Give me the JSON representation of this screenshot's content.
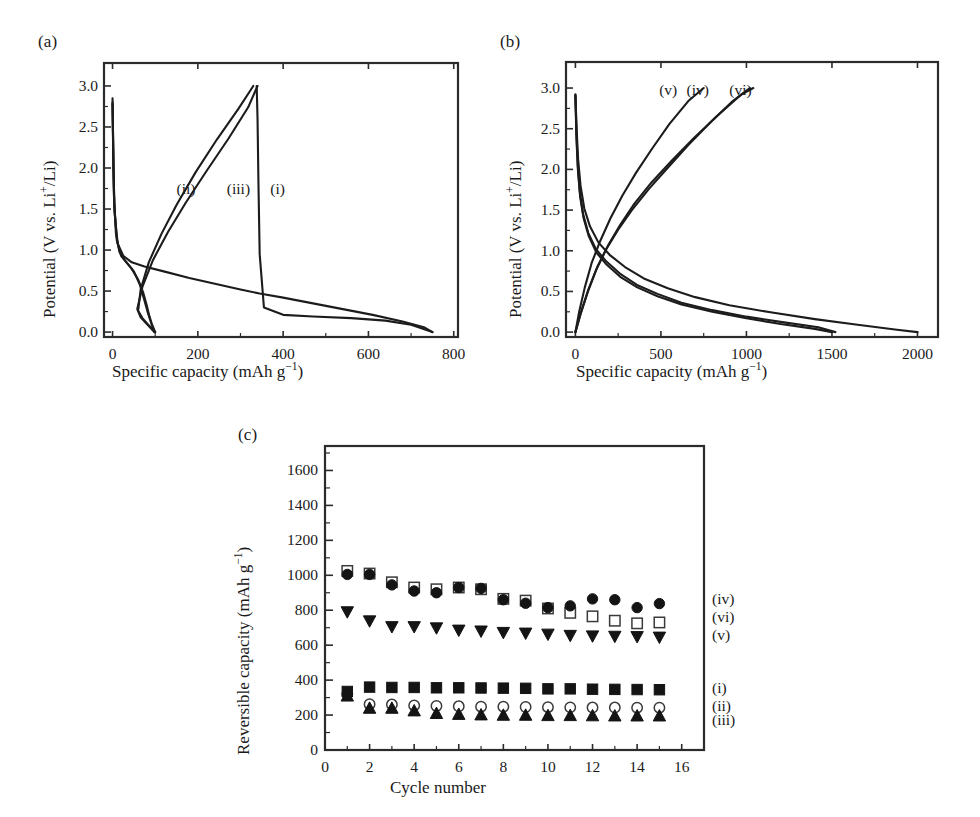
{
  "figure": {
    "background": "#ffffff",
    "line_color": "#1c1c1c",
    "axis_color": "#2b2b2b"
  },
  "panels": {
    "a": {
      "tag": "(a)",
      "xlabel_main": "Specific capacity (mAh g",
      "xlabel_sup": "−1",
      "xlabel_tail": ")",
      "ylabel_main": "Potential (V vs. Li",
      "ylabel_sup": "+",
      "ylabel_tail": "/Li)",
      "xticks": [
        "0",
        "200",
        "400",
        "600",
        "800"
      ],
      "xtick_values": [
        0,
        200,
        400,
        600,
        800
      ],
      "yticks": [
        "0.0",
        "0.5",
        "1.0",
        "1.5",
        "2.0",
        "2.5",
        "3.0"
      ],
      "ytick_values": [
        0.0,
        0.5,
        1.0,
        1.5,
        2.0,
        2.5,
        3.0
      ],
      "xlim": [
        -20,
        810
      ],
      "ylim": [
        -0.06,
        3.28
      ],
      "curve_labels": [
        {
          "text": "(ii)",
          "x": 150,
          "y": 1.75
        },
        {
          "text": "(iii)",
          "x": 268,
          "y": 1.75
        },
        {
          "text": "(i)",
          "x": 370,
          "y": 1.75
        }
      ]
    },
    "b": {
      "tag": "(b)",
      "xlabel_main": "Specific capacity (mAh g",
      "xlabel_sup": "−1",
      "xlabel_tail": ")",
      "ylabel_main": "Potential (V vs. Li",
      "ylabel_sup": "+",
      "ylabel_tail": "/Li)",
      "xticks": [
        "0",
        "500",
        "1000",
        "1500",
        "2000"
      ],
      "xtick_values": [
        0,
        500,
        1000,
        1500,
        2000
      ],
      "yticks": [
        "0.0",
        "0.5",
        "1.0",
        "1.5",
        "2.0",
        "2.5",
        "3.0"
      ],
      "ytick_values": [
        0.0,
        0.5,
        1.0,
        1.5,
        2.0,
        2.5,
        3.0
      ],
      "xlim": [
        -55,
        2120
      ],
      "ylim": [
        -0.06,
        3.32
      ],
      "curve_labels": [
        {
          "text": "(v)",
          "x": 490,
          "y": 2.98
        },
        {
          "text": "(iv)",
          "x": 650,
          "y": 2.98
        },
        {
          "text": "(vi)",
          "x": 900,
          "y": 2.98
        }
      ]
    },
    "c": {
      "tag": "(c)",
      "xlabel": "Cycle number",
      "ylabel_main": "Reversible capacity (mAh g",
      "ylabel_sup": "−1",
      "ylabel_tail": ")",
      "xticks": [
        "0",
        "2",
        "4",
        "6",
        "8",
        "10",
        "12",
        "14",
        "16"
      ],
      "xtick_values": [
        0,
        2,
        4,
        6,
        8,
        10,
        12,
        14,
        16
      ],
      "yticks": [
        "0",
        "200",
        "400",
        "600",
        "800",
        "1000",
        "1200",
        "1400",
        "1600"
      ],
      "ytick_values": [
        0,
        200,
        400,
        600,
        800,
        1000,
        1200,
        1400,
        1600
      ],
      "xlim": [
        0,
        17
      ],
      "ylim": [
        0,
        1740
      ],
      "series_labels": [
        {
          "text": "(iv)",
          "y": 860
        },
        {
          "text": "(vi)",
          "y": 755
        },
        {
          "text": "(v)",
          "y": 655
        },
        {
          "text": "(i)",
          "y": 350
        },
        {
          "text": "(ii)",
          "y": 245
        },
        {
          "text": "(iii)",
          "y": 165
        }
      ]
    }
  },
  "chart_data": [
    {
      "type": "line",
      "panel": "a",
      "title": "(a) Galvanostatic charge-discharge profiles",
      "xlabel": "Specific capacity (mAh g−1)",
      "ylabel": "Potential (V vs. Li+/Li)",
      "xlim": [
        0,
        800
      ],
      "ylim": [
        0.0,
        3.0
      ],
      "grid": false,
      "series": [
        {
          "name": "(i) discharge",
          "style": "solid",
          "points": [
            [
              0,
              2.85
            ],
            [
              2,
              2.0
            ],
            [
              5,
              1.45
            ],
            [
              12,
              1.08
            ],
            [
              25,
              0.93
            ],
            [
              45,
              0.85
            ],
            [
              75,
              0.8
            ],
            [
              120,
              0.74
            ],
            [
              180,
              0.66
            ],
            [
              240,
              0.59
            ],
            [
              300,
              0.52
            ],
            [
              345,
              0.47
            ],
            [
              400,
              0.42
            ],
            [
              470,
              0.35
            ],
            [
              540,
              0.28
            ],
            [
              610,
              0.21
            ],
            [
              680,
              0.13
            ],
            [
              730,
              0.06
            ],
            [
              750,
              0.0
            ]
          ]
        },
        {
          "name": "(i) charge",
          "style": "solid",
          "points": [
            [
              750,
              0.0
            ],
            [
              700,
              0.09
            ],
            [
              640,
              0.14
            ],
            [
              560,
              0.17
            ],
            [
              470,
              0.19
            ],
            [
              400,
              0.21
            ],
            [
              355,
              0.3
            ],
            [
              345,
              0.95
            ],
            [
              342,
              1.85
            ],
            [
              340,
              2.6
            ],
            [
              338,
              3.0
            ]
          ]
        },
        {
          "name": "(ii) discharge",
          "style": "solid",
          "points": [
            [
              0,
              2.8
            ],
            [
              3,
              1.7
            ],
            [
              8,
              1.2
            ],
            [
              16,
              0.98
            ],
            [
              28,
              0.88
            ],
            [
              44,
              0.78
            ],
            [
              60,
              0.64
            ],
            [
              72,
              0.48
            ],
            [
              80,
              0.33
            ],
            [
              86,
              0.2
            ],
            [
              92,
              0.1
            ],
            [
              100,
              0.0
            ]
          ]
        },
        {
          "name": "(ii) charge",
          "style": "solid",
          "points": [
            [
              100,
              0.0
            ],
            [
              82,
              0.1
            ],
            [
              70,
              0.17
            ],
            [
              60,
              0.26
            ],
            [
              66,
              0.52
            ],
            [
              85,
              0.85
            ],
            [
              115,
              1.2
            ],
            [
              150,
              1.55
            ],
            [
              195,
              1.95
            ],
            [
              245,
              2.35
            ],
            [
              295,
              2.72
            ],
            [
              330,
              3.0
            ]
          ]
        },
        {
          "name": "(iii) discharge",
          "style": "solid",
          "points": [
            [
              0,
              2.78
            ],
            [
              4,
              1.55
            ],
            [
              10,
              1.12
            ],
            [
              20,
              0.93
            ],
            [
              34,
              0.84
            ],
            [
              50,
              0.74
            ],
            [
              64,
              0.58
            ],
            [
              74,
              0.4
            ],
            [
              82,
              0.25
            ],
            [
              90,
              0.12
            ],
            [
              98,
              0.0
            ]
          ]
        },
        {
          "name": "(iii) charge",
          "style": "solid",
          "points": [
            [
              98,
              0.0
            ],
            [
              80,
              0.1
            ],
            [
              66,
              0.18
            ],
            [
              58,
              0.28
            ],
            [
              70,
              0.55
            ],
            [
              95,
              0.88
            ],
            [
              130,
              1.22
            ],
            [
              172,
              1.58
            ],
            [
              220,
              1.96
            ],
            [
              272,
              2.36
            ],
            [
              318,
              2.74
            ],
            [
              340,
              3.0
            ]
          ]
        }
      ]
    },
    {
      "type": "line",
      "panel": "b",
      "title": "(b) Galvanostatic charge-discharge profiles",
      "xlabel": "Specific capacity (mAh g−1)",
      "ylabel": "Potential (V vs. Li+/Li)",
      "xlim": [
        0,
        2000
      ],
      "ylim": [
        0.0,
        3.0
      ],
      "grid": false,
      "series": [
        {
          "name": "(iv) discharge",
          "style": "solid",
          "points": [
            [
              0,
              2.92
            ],
            [
              6,
              2.45
            ],
            [
              14,
              2.05
            ],
            [
              26,
              1.72
            ],
            [
              45,
              1.45
            ],
            [
              75,
              1.22
            ],
            [
              120,
              1.02
            ],
            [
              180,
              0.87
            ],
            [
              260,
              0.72
            ],
            [
              360,
              0.58
            ],
            [
              480,
              0.47
            ],
            [
              620,
              0.36
            ],
            [
              800,
              0.27
            ],
            [
              1000,
              0.19
            ],
            [
              1220,
              0.12
            ],
            [
              1420,
              0.06
            ],
            [
              1520,
              0.0
            ]
          ]
        },
        {
          "name": "(iv) charge",
          "style": "solid",
          "points": [
            [
              0,
              0.0
            ],
            [
              30,
              0.22
            ],
            [
              70,
              0.48
            ],
            [
              120,
              0.76
            ],
            [
              180,
              1.02
            ],
            [
              250,
              1.26
            ],
            [
              330,
              1.5
            ],
            [
              430,
              1.76
            ],
            [
              540,
              2.02
            ],
            [
              660,
              2.3
            ],
            [
              790,
              2.58
            ],
            [
              920,
              2.84
            ],
            [
              1020,
              3.0
            ]
          ]
        },
        {
          "name": "(v) discharge",
          "style": "solid",
          "points": [
            [
              0,
              2.9
            ],
            [
              6,
              2.38
            ],
            [
              15,
              1.98
            ],
            [
              28,
              1.66
            ],
            [
              48,
              1.4
            ],
            [
              78,
              1.18
            ],
            [
              122,
              0.98
            ],
            [
              182,
              0.83
            ],
            [
              262,
              0.68
            ],
            [
              362,
              0.55
            ],
            [
              480,
              0.44
            ],
            [
              620,
              0.34
            ],
            [
              800,
              0.25
            ],
            [
              1000,
              0.17
            ],
            [
              1200,
              0.1
            ],
            [
              1400,
              0.04
            ],
            [
              1500,
              0.0
            ]
          ]
        },
        {
          "name": "(v) charge",
          "style": "solid",
          "points": [
            [
              0,
              0.0
            ],
            [
              22,
              0.25
            ],
            [
              55,
              0.55
            ],
            [
              95,
              0.85
            ],
            [
              145,
              1.12
            ],
            [
              205,
              1.4
            ],
            [
              275,
              1.68
            ],
            [
              355,
              1.96
            ],
            [
              450,
              2.26
            ],
            [
              550,
              2.56
            ],
            [
              660,
              2.84
            ],
            [
              750,
              3.0
            ]
          ]
        },
        {
          "name": "(vi) discharge",
          "style": "solid",
          "points": [
            [
              0,
              2.92
            ],
            [
              7,
              2.5
            ],
            [
              16,
              2.12
            ],
            [
              30,
              1.8
            ],
            [
              52,
              1.52
            ],
            [
              85,
              1.3
            ],
            [
              135,
              1.1
            ],
            [
              200,
              0.95
            ],
            [
              290,
              0.8
            ],
            [
              400,
              0.66
            ],
            [
              540,
              0.54
            ],
            [
              700,
              0.43
            ],
            [
              900,
              0.33
            ],
            [
              1150,
              0.24
            ],
            [
              1400,
              0.16
            ],
            [
              1650,
              0.09
            ],
            [
              1880,
              0.03
            ],
            [
              2000,
              0.0
            ]
          ]
        },
        {
          "name": "(vi) charge",
          "style": "solid",
          "points": [
            [
              0,
              0.0
            ],
            [
              32,
              0.24
            ],
            [
              75,
              0.52
            ],
            [
              128,
              0.8
            ],
            [
              190,
              1.06
            ],
            [
              262,
              1.32
            ],
            [
              345,
              1.58
            ],
            [
              445,
              1.84
            ],
            [
              560,
              2.1
            ],
            [
              690,
              2.38
            ],
            [
              830,
              2.66
            ],
            [
              970,
              2.92
            ],
            [
              1040,
              3.0
            ]
          ]
        }
      ]
    },
    {
      "type": "scatter",
      "panel": "c",
      "title": "(c) Cycling performance",
      "xlabel": "Cycle number",
      "ylabel": "Reversible capacity (mAh g−1)",
      "x": [
        1,
        2,
        3,
        4,
        5,
        6,
        7,
        8,
        9,
        10,
        11,
        12,
        13,
        14,
        15
      ],
      "xlim": [
        0,
        17
      ],
      "ylim": [
        0,
        1740
      ],
      "grid": false,
      "series": [
        {
          "name": "(i)",
          "marker": "filled-square",
          "values": [
            335,
            360,
            358,
            358,
            356,
            356,
            355,
            354,
            353,
            350,
            350,
            348,
            347,
            346,
            345
          ]
        },
        {
          "name": "(ii)",
          "marker": "open-circle",
          "values": [
            320,
            262,
            260,
            255,
            252,
            250,
            248,
            248,
            246,
            245,
            244,
            243,
            243,
            242,
            242
          ]
        },
        {
          "name": "(iii)",
          "marker": "filled-triangle-up",
          "values": [
            310,
            240,
            240,
            225,
            210,
            205,
            202,
            200,
            200,
            198,
            198,
            197,
            196,
            196,
            196
          ]
        },
        {
          "name": "(iv)",
          "marker": "filled-circle",
          "values": [
            1005,
            1005,
            945,
            910,
            900,
            930,
            925,
            860,
            840,
            815,
            825,
            865,
            860,
            815,
            838
          ]
        },
        {
          "name": "(v)",
          "marker": "filled-triangle-down",
          "values": [
            790,
            738,
            705,
            705,
            698,
            685,
            680,
            672,
            668,
            662,
            655,
            652,
            650,
            648,
            645
          ]
        },
        {
          "name": "(vi)",
          "marker": "open-square",
          "values": [
            1025,
            1010,
            960,
            930,
            920,
            930,
            920,
            865,
            855,
            810,
            785,
            765,
            740,
            725,
            730
          ]
        }
      ]
    }
  ]
}
